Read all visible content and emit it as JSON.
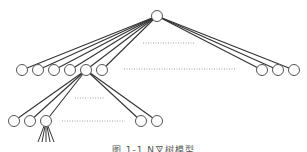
{
  "diagram": {
    "type": "n-ary-tree",
    "colors": {
      "edge": "#333333",
      "node_stroke": "#555555",
      "node_fill": "#ffffff",
      "dots": "#888888"
    },
    "node_radius": 5.5,
    "root": {
      "x": 157,
      "y": 16
    },
    "level1_left": [
      {
        "x": 22,
        "y": 70
      },
      {
        "x": 38,
        "y": 70
      },
      {
        "x": 54,
        "y": 70
      },
      {
        "x": 70,
        "y": 70
      },
      {
        "x": 86,
        "y": 70
      },
      {
        "x": 102,
        "y": 70
      }
    ],
    "level1_right": [
      {
        "x": 262,
        "y": 70
      },
      {
        "x": 278,
        "y": 70
      },
      {
        "x": 294,
        "y": 70
      }
    ],
    "expanded_level1_index": 4,
    "level2": [
      {
        "x": 14,
        "y": 121
      },
      {
        "x": 30,
        "y": 121
      },
      {
        "x": 46,
        "y": 121
      },
      {
        "x": 141,
        "y": 121
      },
      {
        "x": 157,
        "y": 121
      }
    ],
    "expanded_level2_index": 2,
    "level3_stubs": [
      {
        "x": 38,
        "y": 142
      },
      {
        "x": 42,
        "y": 142
      },
      {
        "x": 46,
        "y": 142
      },
      {
        "x": 50,
        "y": 142
      },
      {
        "x": 54,
        "y": 142
      }
    ],
    "ellipses": [
      {
        "x1": 143,
        "x2": 195,
        "y": 43
      },
      {
        "x1": 124,
        "x2": 236,
        "y": 69
      },
      {
        "x1": 75,
        "x2": 105,
        "y": 98
      },
      {
        "x1": 62,
        "x2": 125,
        "y": 121
      }
    ]
  },
  "caption": "图 1-1 N叉树模型"
}
